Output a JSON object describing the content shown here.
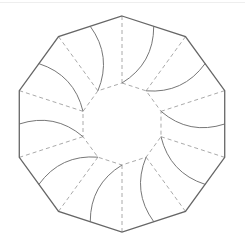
{
  "diagram": {
    "type": "decagon-pinwheel-fold-pattern",
    "center": [
      122,
      124
    ],
    "outer_radius": 108,
    "inner_radius": 41,
    "sides": 10,
    "rotation_deg": -90,
    "colors": {
      "outer_edge": "#666666",
      "curve": "#777777",
      "dashed": "#aaaaaa"
    },
    "curve_bulge": 0.28
  }
}
